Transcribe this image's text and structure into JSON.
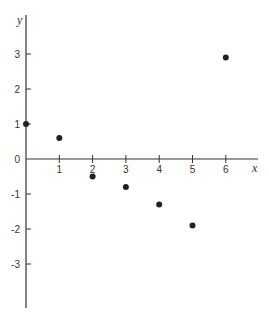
{
  "chart_data": {
    "type": "scatter",
    "title": "",
    "xlabel": "x",
    "ylabel": "y",
    "x": [
      0,
      1,
      2,
      3,
      4,
      5,
      6
    ],
    "y": [
      1.0,
      0.6,
      -0.5,
      -0.8,
      -1.3,
      -1.9,
      2.9
    ],
    "xlim": [
      0,
      6.9
    ],
    "ylim": [
      -4.3,
      4.1
    ],
    "xticks": [
      1,
      2,
      3,
      4,
      5,
      6
    ],
    "yticks": [
      3,
      2,
      1,
      0,
      -1,
      -2,
      -3
    ],
    "xtick_labels": [
      "1",
      "2",
      "3",
      "4",
      "5",
      "6"
    ],
    "ytick_labels": [
      "3",
      "2",
      "1",
      "0",
      "-1",
      "-2",
      "-3"
    ],
    "grid": false,
    "legend": null,
    "marker_color": "#222222",
    "axis_color": "#333333"
  }
}
